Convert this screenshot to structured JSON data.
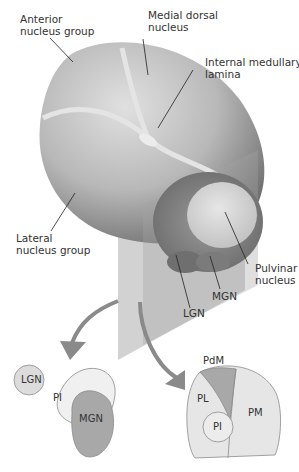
{
  "labels": {
    "anterior": "Anterior\nnucleus group",
    "medial_dorsal": "Medial dorsal\nnucleus",
    "internal_medullary": "Internal medullary\nlamina",
    "lateral": "Lateral\nnucleus group",
    "pulvinar": "Pulvinar\nnucleus",
    "mgn": "MGN",
    "lgn": "LGN"
  },
  "section_left": {
    "lgn": "LGN",
    "pi": "PI",
    "mgn": "MGN"
  },
  "section_right": {
    "pdm": "PdM",
    "pl": "PL",
    "pi": "PI",
    "pm": "PM"
  },
  "colors": {
    "thalamus_light": "#d4d4d4",
    "thalamus_dark": "#7a7a7a",
    "lamina": "#e6e6e6",
    "plane": "#9a9a9a",
    "arrow": "#8a8a8a",
    "region_light": "#e9e9e9",
    "region_mid": "#d8d8d8",
    "region_dark": "#a9a9a9"
  }
}
